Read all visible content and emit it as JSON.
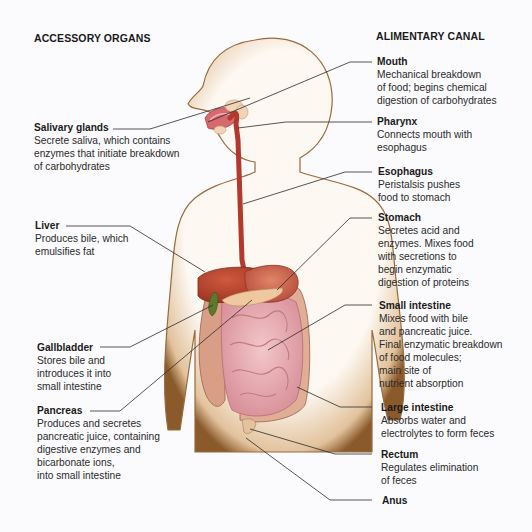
{
  "headings": {
    "left": "ACCESSORY ORGANS",
    "right": "ALIMENTARY CANAL"
  },
  "accessory_organs": [
    {
      "name": "Salivary glands",
      "description": "Secrete saliva, which contains\nenzymes that initiate breakdown\nof carbohydrates"
    },
    {
      "name": "Liver",
      "description": "Produces bile, which\nemulsifies fat"
    },
    {
      "name": "Gallbladder",
      "description": "Stores bile and\nintroduces it into\nsmall intestine"
    },
    {
      "name": "Pancreas",
      "description": "Produces and secretes\npancreatic juice, containing\ndigestive enzymes and\nbicarbonate ions,\ninto small intestine"
    }
  ],
  "alimentary_canal": [
    {
      "name": "Mouth",
      "description": "Mechanical breakdown\nof food; begins chemical\ndigestion of carbohydrates"
    },
    {
      "name": "Pharynx",
      "description": "Connects mouth with\nesophagus"
    },
    {
      "name": "Esophagus",
      "description": "Peristalsis pushes\nfood to stomach"
    },
    {
      "name": "Stomach",
      "description": "Secretes acid and\nenzymes. Mixes food\nwith secretions to\nbegin enzymatic\ndigestion of proteins"
    },
    {
      "name": "Small intestine",
      "description": "Mixes food with bile\nand pancreatic juice.\nFinal enzymatic breakdown\nof food molecules;\nmain site of\nnutrient absorption"
    },
    {
      "name": "Large intestine",
      "description": "Absorbs water and\nelectrolytes to form feces"
    },
    {
      "name": "Rectum",
      "description": "Regulates elimination\nof feces"
    },
    {
      "name": "Anus",
      "description": ""
    }
  ],
  "colors": {
    "skin_fill": "#fbf3ea",
    "skin_edge": "#8a5a2b",
    "liver": "#b8452f",
    "stomach": "#c9634a",
    "esophagus": "#b2392c",
    "small_intestine": "#eab3b8",
    "large_intestine": "#d99e86",
    "pancreas": "#efc8a0",
    "gallbladder": "#5c7a2a",
    "salivary": "#f1d3b5",
    "leader_line": "#2b2b2b"
  }
}
